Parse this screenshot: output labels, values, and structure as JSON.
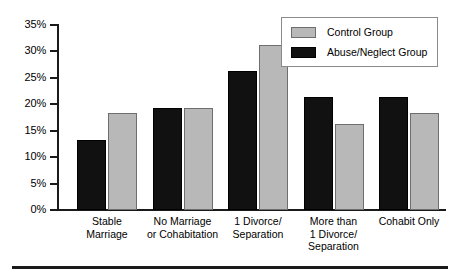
{
  "chart_data": {
    "type": "bar",
    "title": "",
    "subtitle": "",
    "xlabel": "",
    "ylabel": "",
    "ylim": [
      0,
      35
    ],
    "ytick_labels": [
      "0%",
      "5%",
      "10%",
      "15%",
      "20%",
      "25%",
      "30%",
      "35%"
    ],
    "ytick_values": [
      0,
      5,
      10,
      15,
      20,
      25,
      30,
      35
    ],
    "grid": false,
    "legend_position": "top-right",
    "categories": [
      "Stable Marriage",
      "No Marriage or Cohabitation",
      "1 Divorce/ Separation",
      "More than 1 Divorce/ Separation",
      "Cohabit Only"
    ],
    "category_lines": [
      [
        "Stable",
        "Marriage"
      ],
      [
        "No Marriage",
        "or Cohabitation"
      ],
      [
        "1 Divorce/",
        "Separation"
      ],
      [
        "More than",
        "1 Divorce/",
        "Separation"
      ],
      [
        "Cohabit Only"
      ]
    ],
    "series": [
      {
        "name": "Abuse/Neglect Group",
        "color": "#111111",
        "values": [
          13.2,
          19.3,
          26.3,
          21.3,
          21.4
        ]
      },
      {
        "name": "Control Group",
        "color": "#b8b8b8",
        "values": [
          18.3,
          19.3,
          31.3,
          16.3,
          18.4
        ]
      }
    ]
  },
  "legend": {
    "items": [
      {
        "label": "Control Group",
        "swatch": "gray"
      },
      {
        "label": "Abuse/Neglect Group",
        "swatch": "black"
      }
    ]
  },
  "colors": {
    "series_black": "#111111",
    "series_gray": "#b8b8b8",
    "axis": "#1a1a1a",
    "background": "#ffffff"
  }
}
